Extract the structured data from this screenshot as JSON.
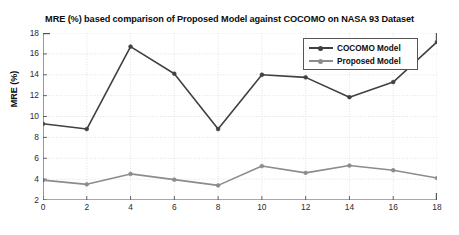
{
  "chart_data": {
    "type": "line",
    "title": "MRE (%) based comparison of Proposed Model against COCOMO on NASA 93 Dataset",
    "xlabel": "",
    "ylabel": "MRE (%)",
    "x": [
      0,
      2,
      4,
      6,
      8,
      10,
      12,
      14,
      16,
      18
    ],
    "xlim": [
      0,
      18
    ],
    "ylim": [
      2,
      18
    ],
    "xticks": [
      0,
      2,
      4,
      6,
      8,
      10,
      12,
      14,
      16,
      18
    ],
    "yticks": [
      2,
      4,
      6,
      8,
      10,
      12,
      14,
      16,
      18
    ],
    "grid": true,
    "legend_position": "upper right",
    "series": [
      {
        "name": "COCOMO Model",
        "color": "#404040",
        "values": [
          9.3,
          8.8,
          16.7,
          14.1,
          8.8,
          14.0,
          13.75,
          11.85,
          13.3,
          17.15
        ]
      },
      {
        "name": "Proposed Model",
        "color": "#8c8c8c",
        "values": [
          3.9,
          3.5,
          4.5,
          3.95,
          3.4,
          5.25,
          4.6,
          5.3,
          4.85,
          4.1
        ]
      }
    ]
  },
  "axes": {
    "ylabel": "MRE (%)",
    "ytick_labels": [
      "18",
      "16",
      "14",
      "12",
      "10",
      "8",
      "6",
      "4",
      "2"
    ],
    "xtick_labels": [
      "0",
      "2",
      "4",
      "6",
      "8",
      "10",
      "12",
      "14",
      "16",
      "18"
    ]
  },
  "legend": {
    "entries": [
      {
        "label": "COCOMO Model",
        "color": "#404040"
      },
      {
        "label": "Proposed Model",
        "color": "#8c8c8c"
      }
    ]
  },
  "colors": {
    "background": "#ffffff",
    "axis": "#555555",
    "grid": "#d9d9d9",
    "text": "#0d0d0d",
    "cocomo": "#404040",
    "proposed": "#8c8c8c"
  }
}
